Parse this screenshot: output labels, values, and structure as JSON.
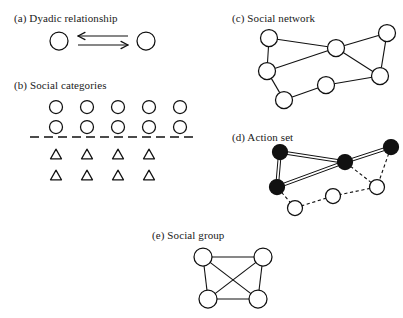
{
  "figure": {
    "background_color": "#ffffff",
    "ink_color": "#111111"
  },
  "panels": [
    {
      "key": "a",
      "label": "(a) Dyadic relationship",
      "label_x": 14,
      "label_y": 12,
      "canvas": {
        "x": 48,
        "y": 24,
        "w": 110,
        "h": 34
      },
      "node_radius": 9,
      "nodes": [
        {
          "id": "a1",
          "cx": 11,
          "cy": 17,
          "type": "open"
        },
        {
          "id": "a2",
          "cx": 98,
          "cy": 17,
          "type": "open"
        }
      ],
      "arrows": [
        {
          "id": "arrow-left",
          "x1": 80,
          "y1": 12,
          "x2": 30,
          "y2": 12,
          "direction": "left"
        },
        {
          "id": "arrow-right",
          "x1": 30,
          "y1": 21,
          "x2": 80,
          "y2": 21,
          "direction": "right"
        }
      ]
    },
    {
      "key": "b",
      "label": "(b) Social categories",
      "label_x": 14,
      "label_y": 79,
      "canvas": {
        "x": 28,
        "y": 96,
        "w": 170,
        "h": 92
      },
      "node_radius": 6.5,
      "triangle_size": 11,
      "circle_rows": [
        {
          "row": 1,
          "cy": 11,
          "cxs": [
            28,
            59,
            90,
            121,
            152
          ]
        },
        {
          "row": 2,
          "cy": 31,
          "cxs": [
            28,
            59,
            90,
            121,
            152
          ]
        }
      ],
      "divider": {
        "x1": 2,
        "y1": 41,
        "x2": 168,
        "y2": 41
      },
      "triangle_rows": [
        {
          "row": 1,
          "cy": 58,
          "cxs": [
            28,
            59,
            90,
            121
          ]
        },
        {
          "row": 2,
          "cy": 79,
          "cxs": [
            28,
            59,
            90,
            121
          ]
        }
      ]
    },
    {
      "key": "c",
      "label": "(c) Social network",
      "label_x": 232,
      "label_y": 12,
      "canvas": {
        "x": 252,
        "y": 24,
        "w": 146,
        "h": 78
      },
      "node_radius": 8.5,
      "nodes": [
        {
          "id": "c1",
          "cx": 17,
          "cy": 14,
          "type": "open"
        },
        {
          "id": "c2",
          "cx": 84,
          "cy": 24,
          "type": "open"
        },
        {
          "id": "c3",
          "cx": 135,
          "cy": 9,
          "type": "open"
        },
        {
          "id": "c4",
          "cx": 15,
          "cy": 47,
          "type": "open"
        },
        {
          "id": "c5",
          "cx": 128,
          "cy": 52,
          "type": "open"
        },
        {
          "id": "c6",
          "cx": 74,
          "cy": 61,
          "type": "open"
        },
        {
          "id": "c7",
          "cx": 32,
          "cy": 76,
          "type": "open"
        }
      ],
      "edges": [
        {
          "from": "c1",
          "to": "c2",
          "style": "solid"
        },
        {
          "from": "c1",
          "to": "c4",
          "style": "solid"
        },
        {
          "from": "c2",
          "to": "c3",
          "style": "solid"
        },
        {
          "from": "c2",
          "to": "c4",
          "style": "solid"
        },
        {
          "from": "c2",
          "to": "c5",
          "style": "solid"
        },
        {
          "from": "c3",
          "to": "c5",
          "style": "solid"
        },
        {
          "from": "c4",
          "to": "c7",
          "style": "solid"
        },
        {
          "from": "c5",
          "to": "c6",
          "style": "solid"
        },
        {
          "from": "c6",
          "to": "c7",
          "style": "solid"
        }
      ]
    },
    {
      "key": "d",
      "label": "(d) Action set",
      "label_x": 232,
      "label_y": 131,
      "canvas": {
        "x": 252,
        "y": 142,
        "w": 146,
        "h": 70
      },
      "node_radius": 7.5,
      "nodes": [
        {
          "id": "d1",
          "cx": 28,
          "cy": 10,
          "type": "filled"
        },
        {
          "id": "d2",
          "cx": 93,
          "cy": 20,
          "type": "filled"
        },
        {
          "id": "d3",
          "cx": 139,
          "cy": 5,
          "type": "filled"
        },
        {
          "id": "d4",
          "cx": 25,
          "cy": 45,
          "type": "filled"
        },
        {
          "id": "d5",
          "cx": 125,
          "cy": 45,
          "type": "open"
        },
        {
          "id": "d6",
          "cx": 81,
          "cy": 54,
          "type": "open"
        },
        {
          "id": "d7",
          "cx": 43,
          "cy": 66,
          "type": "open"
        }
      ],
      "edges": [
        {
          "from": "d1",
          "to": "d2",
          "style": "double"
        },
        {
          "from": "d1",
          "to": "d4",
          "style": "double"
        },
        {
          "from": "d2",
          "to": "d3",
          "style": "double"
        },
        {
          "from": "d2",
          "to": "d4",
          "style": "double"
        },
        {
          "from": "d2",
          "to": "d5",
          "style": "dashed"
        },
        {
          "from": "d3",
          "to": "d5",
          "style": "dashed"
        },
        {
          "from": "d4",
          "to": "d7",
          "style": "dashed"
        },
        {
          "from": "d5",
          "to": "d6",
          "style": "dashed"
        },
        {
          "from": "d6",
          "to": "d7",
          "style": "dashed"
        }
      ]
    },
    {
      "key": "e",
      "label": "(e) Social group",
      "label_x": 152,
      "label_y": 229,
      "canvas": {
        "x": 190,
        "y": 244,
        "w": 86,
        "h": 66
      },
      "node_radius": 9,
      "nodes": [
        {
          "id": "e1",
          "cx": 13,
          "cy": 13,
          "type": "open"
        },
        {
          "id": "e2",
          "cx": 73,
          "cy": 13,
          "type": "open"
        },
        {
          "id": "e3",
          "cx": 18,
          "cy": 55,
          "type": "open"
        },
        {
          "id": "e4",
          "cx": 68,
          "cy": 55,
          "type": "open"
        }
      ],
      "edges": [
        {
          "from": "e1",
          "to": "e2",
          "style": "solid"
        },
        {
          "from": "e1",
          "to": "e3",
          "style": "solid"
        },
        {
          "from": "e1",
          "to": "e4",
          "style": "solid"
        },
        {
          "from": "e2",
          "to": "e3",
          "style": "solid"
        },
        {
          "from": "e2",
          "to": "e4",
          "style": "solid"
        },
        {
          "from": "e3",
          "to": "e4",
          "style": "solid"
        }
      ]
    }
  ]
}
